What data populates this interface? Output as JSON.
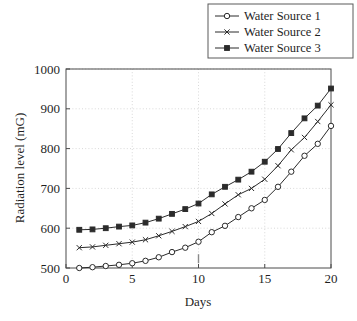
{
  "chart_data": {
    "type": "line",
    "title": "",
    "xlabel": "Days",
    "ylabel": "Radiation level (mG)",
    "xlim": [
      0,
      20
    ],
    "ylim": [
      500,
      1000
    ],
    "xticks": [
      0,
      5,
      10,
      15,
      20
    ],
    "yticks": [
      500,
      600,
      700,
      800,
      900,
      1000
    ],
    "xtick_labels": [
      "0",
      "5",
      "10",
      "15",
      "20"
    ],
    "ytick_labels": [
      "500",
      "600",
      "700",
      "800",
      "900",
      "1000"
    ],
    "grid": true,
    "legend_position": "top-right-outside",
    "x": [
      1,
      2,
      3,
      4,
      5,
      6,
      7,
      8,
      9,
      10,
      11,
      12,
      13,
      14,
      15,
      16,
      17,
      18,
      19,
      20
    ],
    "series": [
      {
        "name": "Water Source 1",
        "marker": "circle",
        "color": "#2b2b2b",
        "values": [
          500,
          502,
          505,
          508,
          512,
          518,
          527,
          540,
          551,
          566,
          590,
          606,
          628,
          650,
          671,
          704,
          742,
          782,
          812,
          857
        ]
      },
      {
        "name": "Water Source 2",
        "marker": "x",
        "color": "#2b2b2b",
        "values": [
          551,
          553,
          557,
          561,
          565,
          571,
          581,
          592,
          604,
          617,
          637,
          661,
          684,
          700,
          723,
          757,
          797,
          828,
          868,
          910
        ]
      },
      {
        "name": "Water Source 3",
        "marker": "square",
        "color": "#2b2b2b",
        "values": [
          596,
          597,
          600,
          604,
          607,
          614,
          624,
          636,
          648,
          662,
          685,
          704,
          722,
          742,
          767,
          799,
          839,
          876,
          908,
          951
        ]
      }
    ],
    "annotations": [
      {
        "name": "day-10-tick",
        "type": "vertical-tick",
        "x": 10,
        "y": 512
      }
    ]
  },
  "legend": {
    "entries": [
      {
        "label": "Water Source 1",
        "marker": "circle-marker-icon"
      },
      {
        "label": "Water Source 2",
        "marker": "x-marker-icon"
      },
      {
        "label": "Water Source 3",
        "marker": "square-marker-icon"
      }
    ]
  },
  "axes": {
    "x_title": "Days",
    "y_title": "Radiation level (mG)"
  },
  "style": {
    "line_color": "#2b2b2b",
    "grid_color": "#c9c9c9",
    "axis_color": "#4a4a4a",
    "background": "#ffffff"
  }
}
